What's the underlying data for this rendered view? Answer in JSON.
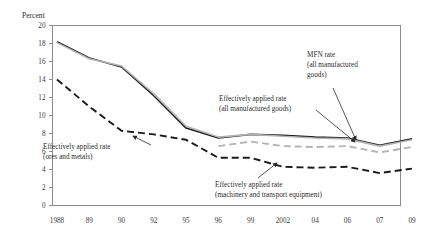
{
  "chart_data": {
    "type": "line",
    "title": "",
    "ylabel": "Percent",
    "xlabel": "",
    "ylim": [
      0,
      20
    ],
    "ytick_step": 2,
    "yticks": [
      "0",
      "2",
      "4",
      "6",
      "8",
      "10",
      "12",
      "14",
      "16",
      "18",
      "20"
    ],
    "grid": false,
    "legend_position": "inline-annotations",
    "categories": [
      "1988",
      "89",
      "90",
      "92",
      "95",
      "96",
      "99",
      "2002",
      "04",
      "06",
      "07",
      "09"
    ],
    "series": [
      {
        "name": "MFN rate (all manufactured goods)",
        "style": "solid",
        "color": "#1a1a1a",
        "values": [
          18.2,
          16.4,
          15.4,
          12.2,
          8.6,
          7.5,
          7.9,
          7.8,
          7.6,
          7.5,
          6.7,
          7.4
        ]
      },
      {
        "name": "Effectively applied rate (all manufactured goods)",
        "style": "solid",
        "color": "#b3b3b3",
        "values": [
          18.1,
          16.3,
          15.5,
          12.4,
          8.8,
          7.6,
          7.9,
          7.7,
          7.5,
          7.4,
          6.6,
          7.3
        ]
      },
      {
        "name": "Effectively applied rate (machinery and transport equipment)",
        "style": "dashed",
        "color": "#b3b3b3",
        "values": [
          null,
          null,
          null,
          null,
          null,
          6.6,
          7.1,
          6.6,
          6.5,
          6.6,
          5.9,
          6.5
        ]
      },
      {
        "name": "Effectively applied rate (ores and metals)",
        "style": "dashed",
        "color": "#1a1a1a",
        "values": [
          14.0,
          11.0,
          8.3,
          7.9,
          7.3,
          5.3,
          5.3,
          4.3,
          4.2,
          4.3,
          3.6,
          4.1
        ]
      }
    ],
    "annotations": [
      {
        "name": "mfn-rate",
        "line1": "MFN rate",
        "line2": "(all manufactured",
        "line3": "goods)"
      },
      {
        "name": "effectively-applied-manufactured",
        "line1": "Effectively applied rate",
        "line2": "(all manufactured goods)",
        "line3": ""
      },
      {
        "name": "effectively-applied-ores",
        "line1": "Effectively applied rate",
        "line2": "(ores and metals)",
        "line3": ""
      },
      {
        "name": "effectively-applied-machinery",
        "line1": "Effectively applied rate",
        "line2": "(machinery and transport equipment)",
        "line3": ""
      }
    ]
  },
  "axis": {
    "unit_label": "Percent"
  }
}
